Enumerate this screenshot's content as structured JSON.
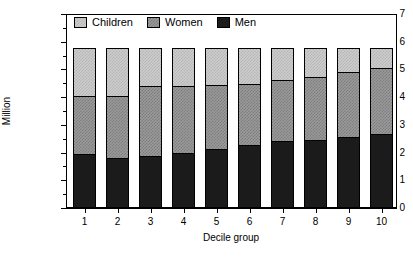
{
  "chart_data": {
    "type": "bar",
    "title": "",
    "subtitle": "",
    "stacked": true,
    "xlabel": "Decile group",
    "ylabel": "Million",
    "categories": [
      "1",
      "2",
      "3",
      "4",
      "5",
      "6",
      "7",
      "8",
      "9",
      "10"
    ],
    "ylim": [
      0,
      7
    ],
    "y_ticks": [
      0,
      1,
      2,
      3,
      4,
      5,
      6,
      7
    ],
    "y_tick_labels": [
      "0",
      "1",
      "2",
      "3",
      "4",
      "5",
      "6",
      "7"
    ],
    "y_minor_ticks": [
      0.5,
      1.5,
      2.5,
      3.5,
      4.5,
      5.5,
      6.5
    ],
    "grid": false,
    "legend_position": "top-left inside",
    "series": [
      {
        "name": "Men",
        "color": "#1b1b1b",
        "values": [
          1.9,
          1.77,
          1.84,
          1.95,
          2.09,
          2.24,
          2.38,
          2.42,
          2.53,
          2.64
        ]
      },
      {
        "name": "Women",
        "color": "#9a9a9a",
        "values": [
          2.09,
          2.23,
          2.51,
          2.42,
          2.3,
          2.2,
          2.2,
          2.28,
          2.35,
          2.36
        ]
      },
      {
        "name": "Children",
        "color": "#cdcdcd",
        "values": [
          1.76,
          1.75,
          1.4,
          1.38,
          1.36,
          1.31,
          1.17,
          1.05,
          0.87,
          0.75
        ]
      }
    ],
    "totals": [
      5.75,
      5.75,
      5.75,
      5.75,
      5.75,
      5.75,
      5.75,
      5.75,
      5.75,
      5.75
    ],
    "cumulative_men_plus_women": [
      3.99,
      4.0,
      4.35,
      4.37,
      4.39,
      4.44,
      4.58,
      4.7,
      4.88,
      5.0
    ]
  },
  "legend": {
    "items": [
      {
        "label": "Children",
        "swatch": "children-swatch"
      },
      {
        "label": "Women",
        "swatch": "women-swatch"
      },
      {
        "label": "Men",
        "swatch": "men-swatch"
      }
    ]
  }
}
